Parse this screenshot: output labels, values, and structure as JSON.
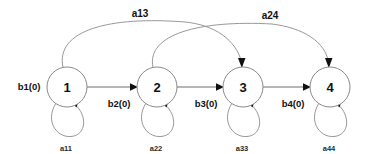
{
  "diagram": {
    "type": "state-transition-diagram",
    "background_color": "#ffffff",
    "node_stroke_color": "#8a8a8a",
    "edge_color": "#6f6f6f",
    "arc_color": "#8c8c8c",
    "label_color": "#111111",
    "nodes": [
      {
        "id": "1",
        "label": "1",
        "cx": 67,
        "cy": 87,
        "r": 20
      },
      {
        "id": "2",
        "label": "2",
        "cx": 157,
        "cy": 87,
        "r": 20
      },
      {
        "id": "3",
        "label": "3",
        "cx": 243,
        "cy": 87,
        "r": 20
      },
      {
        "id": "4",
        "label": "4",
        "cx": 330,
        "cy": 87,
        "r": 20
      }
    ],
    "entry_label": "b1(0)",
    "forward_edges": [
      {
        "from": "1",
        "to": "2",
        "label": "b2(0)"
      },
      {
        "from": "2",
        "to": "3",
        "label": "b3(0)"
      },
      {
        "from": "3",
        "to": "4",
        "label": "b4(0)"
      }
    ],
    "skip_arcs": [
      {
        "from": "1",
        "to": "3",
        "label": "a13"
      },
      {
        "from": "2",
        "to": "4",
        "label": "a24"
      }
    ],
    "self_loops": [
      {
        "node": "1",
        "label": "a11"
      },
      {
        "node": "2",
        "label": "a22"
      },
      {
        "node": "3",
        "label": "a33"
      },
      {
        "node": "4",
        "label": "a44"
      }
    ]
  }
}
